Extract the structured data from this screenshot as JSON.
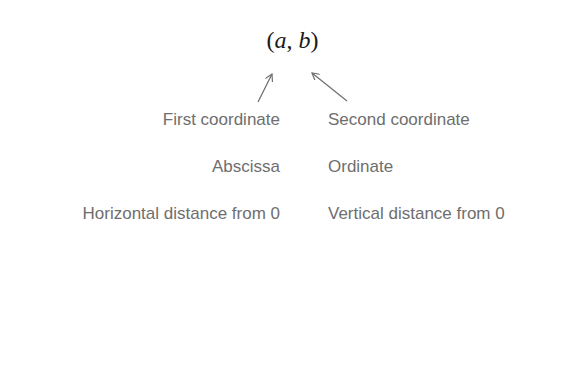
{
  "expression": {
    "open_paren": "(",
    "first": "a",
    "comma": ", ",
    "second": "b",
    "close_paren": ")"
  },
  "rows": [
    {
      "left": "First coordinate",
      "right": "Second coordinate"
    },
    {
      "left": "Abscissa",
      "right": "Ordinate"
    },
    {
      "left": "Horizontal distance from 0",
      "right": "Vertical distance from 0"
    }
  ],
  "colors": {
    "text": "#6e6e6e",
    "expression": "#1a1a1a",
    "arrow": "#6e6e6e",
    "background": "#ffffff"
  }
}
